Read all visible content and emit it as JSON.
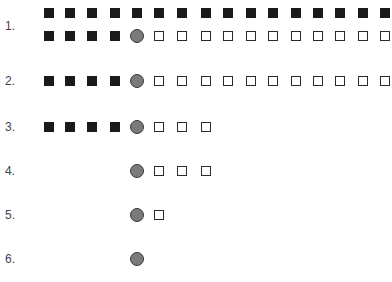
{
  "labels": [
    "1.",
    "2.",
    "3.",
    "4.",
    "5.",
    "6."
  ],
  "columns_x": [
    49,
    70,
    92,
    115,
    137,
    159,
    182,
    206,
    228,
    251,
    273,
    296,
    318,
    340,
    363,
    385
  ],
  "rows": [
    {
      "label_index": 0,
      "label_y": 26,
      "lines": [
        {
          "y": 13,
          "symbols": [
            "filled",
            "filled",
            "filled",
            "filled",
            "filled",
            "filled",
            "filled",
            "filled",
            "filled",
            "filled",
            "filled",
            "filled",
            "filled",
            "filled",
            "filled",
            "filled"
          ],
          "start_col": 0
        },
        {
          "y": 36,
          "symbols": [
            "filled",
            "filled",
            "filled",
            "filled",
            "circle",
            "open",
            "open",
            "open",
            "open",
            "open",
            "open",
            "open",
            "open",
            "open",
            "open",
            "open"
          ],
          "start_col": 0
        }
      ]
    },
    {
      "label_index": 1,
      "label_y": 81,
      "lines": [
        {
          "y": 81,
          "symbols": [
            "filled",
            "filled",
            "filled",
            "filled",
            "circle",
            "open",
            "open",
            "open",
            "open",
            "open",
            "open",
            "open",
            "open",
            "open",
            "open",
            "open"
          ],
          "start_col": 0
        }
      ]
    },
    {
      "label_index": 2,
      "label_y": 127,
      "lines": [
        {
          "y": 127,
          "symbols": [
            "filled",
            "filled",
            "filled",
            "filled",
            "circle",
            "open",
            "open",
            "open"
          ],
          "start_col": 0
        }
      ]
    },
    {
      "label_index": 3,
      "label_y": 171,
      "lines": [
        {
          "y": 171,
          "symbols": [
            "circle",
            "open",
            "open",
            "open"
          ],
          "start_col": 4
        }
      ]
    },
    {
      "label_index": 4,
      "label_y": 215,
      "lines": [
        {
          "y": 215,
          "symbols": [
            "circle",
            "open"
          ],
          "start_col": 4
        }
      ]
    },
    {
      "label_index": 5,
      "label_y": 259,
      "lines": [
        {
          "y": 259,
          "symbols": [
            "circle"
          ],
          "start_col": 4
        }
      ]
    }
  ],
  "legend_semantics": {
    "filled": "filled-square",
    "circle": "gray-circle",
    "open": "open-square"
  }
}
